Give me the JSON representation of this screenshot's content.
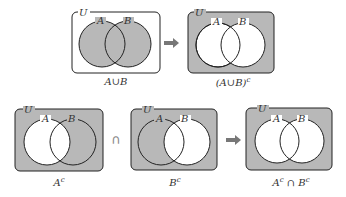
{
  "colors": {
    "shade": "#b8b8b8",
    "stroke": "#222222",
    "arrow": "#777777",
    "bg": "#ffffff"
  },
  "universe_label": "U",
  "set_a_label": "A",
  "set_b_label": "B",
  "panels": [
    {
      "id": "union",
      "caption": "A∪B",
      "shade": "A∪B"
    },
    {
      "id": "union-complement",
      "caption_main": "(A∪B)",
      "caption_sup": "c",
      "shade": "(A∪B)^c"
    },
    {
      "id": "a-complement",
      "caption_main": "A",
      "caption_sup": "c",
      "shade": "A^c"
    },
    {
      "id": "b-complement",
      "caption_main": "B",
      "caption_sup": "c",
      "shade": "B^c"
    },
    {
      "id": "intersection-complements",
      "caption_a": "A",
      "caption_a_sup": "c",
      "caption_op": " ∩ ",
      "caption_b": "B",
      "caption_b_sup": "c",
      "shade": "A^c ∩ B^c"
    }
  ],
  "operators": {
    "intersect": "∩",
    "arrow": "➡"
  }
}
